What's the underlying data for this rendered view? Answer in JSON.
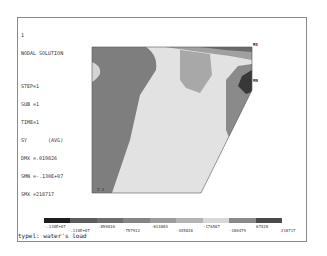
{
  "window": {
    "frame_number": "1"
  },
  "info_block": {
    "lines": [
      "NODAL SOLUTION",
      "STEP=1",
      "SUB =1",
      "TIME=1",
      "SY       (AVG)",
      "DMX =.019826",
      "SMN =-.130E+07",
      "SMX =218717"
    ]
  },
  "plot": {
    "max_label": "MX",
    "min_label": "MN",
    "triad_label": "Z  X",
    "colors": {
      "band_darkest": "#2e2e2e",
      "band_dark": "#5a5a5a",
      "band_mid": "#7c7c7c",
      "band_midlight": "#a8a8a8",
      "band_light": "#d6d6d6",
      "band_lightest": "#e6e6e6"
    }
  },
  "legend": {
    "bands": [
      "#1e1e1e",
      "#5c5c5c",
      "#6e6e6e",
      "#848484",
      "#9c9c9c",
      "#b4b4b4",
      "#d8d8d8",
      "#8a8a8a",
      "#4a4a4a"
    ],
    "labels_row1": [
      "-.130E+07",
      "-859010",
      "-614804",
      "-176587",
      "67428"
    ],
    "labels_row2": [
      "-.110E+07",
      "-757912",
      "-445828",
      "-180479",
      "218717"
    ]
  },
  "caption": "typel: water's load"
}
